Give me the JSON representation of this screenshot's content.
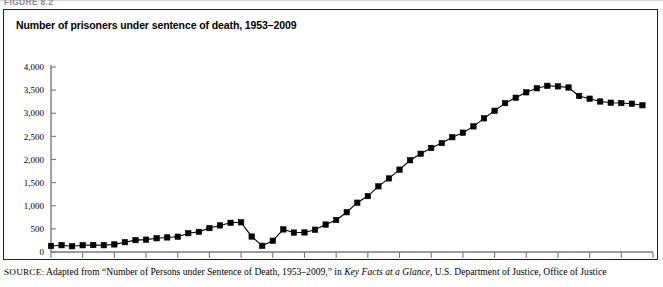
{
  "figure": {
    "number_label": "FIGURE 8.2",
    "title": "Number of prisoners under sentence of death, 1953–2009"
  },
  "source": {
    "label": "SOURCE:",
    "text_before_italic": " Adapted from “Number of Persons under Sentence of Death, 1953–2009,” in ",
    "italic_title": "Key Facts at a Glance",
    "text_after_italic": ", U.S. Department of Justice, Office of Justice"
  },
  "chart_data": {
    "type": "line",
    "title": "Number of prisoners under sentence of death, 1953–2009",
    "xlabel": "",
    "ylabel": "",
    "xlim": [
      1953,
      2010
    ],
    "ylim": [
      0,
      4000
    ],
    "grid": false,
    "legend": "none",
    "marker": "square",
    "line_color": "#000000",
    "marker_color": "#000000",
    "xticks": [
      1953,
      1956,
      1959,
      1962,
      1965,
      1968,
      1971,
      1974,
      1977,
      1980,
      1983,
      1986,
      1989,
      1992,
      1995,
      1998,
      2001,
      2004,
      2007,
      2010
    ],
    "yticks": [
      0,
      500,
      1000,
      1500,
      2000,
      2500,
      3000,
      3500,
      4000
    ],
    "ytick_labels": [
      "0",
      "500",
      "1,000",
      "1,500",
      "2,000",
      "2,500",
      "3,000",
      "3,500",
      "4,000"
    ],
    "x": [
      1953,
      1954,
      1955,
      1956,
      1957,
      1958,
      1959,
      1960,
      1961,
      1962,
      1963,
      1964,
      1965,
      1966,
      1967,
      1968,
      1969,
      1970,
      1971,
      1972,
      1973,
      1974,
      1975,
      1976,
      1977,
      1978,
      1979,
      1980,
      1981,
      1982,
      1983,
      1984,
      1985,
      1986,
      1987,
      1988,
      1989,
      1990,
      1991,
      1992,
      1993,
      1994,
      1995,
      1996,
      1997,
      1998,
      1999,
      2000,
      2001,
      2002,
      2003,
      2004,
      2005,
      2006,
      2007,
      2008,
      2009
    ],
    "values": [
      131,
      147,
      125,
      146,
      151,
      147,
      164,
      212,
      257,
      267,
      297,
      315,
      331,
      406,
      435,
      517,
      575,
      631,
      642,
      334,
      134,
      244,
      488,
      420,
      423,
      482,
      593,
      692,
      860,
      1066,
      1209,
      1420,
      1591,
      1781,
      1984,
      2124,
      2250,
      2356,
      2482,
      2580,
      2716,
      2890,
      3054,
      3219,
      3335,
      3452,
      3540,
      3593,
      3581,
      3557,
      3374,
      3315,
      3254,
      3228,
      3220,
      3207,
      3173
    ]
  }
}
